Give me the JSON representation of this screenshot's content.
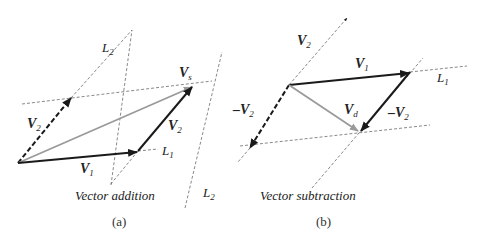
{
  "panels": [
    {
      "id": "a",
      "caption": "(a)",
      "title": "Vector addition",
      "labels": {
        "L2_top": "L",
        "L2_top_sub": "2",
        "V2_left": "V",
        "V2_left_sub": "2",
        "V1": "V",
        "V1_sub": "1",
        "V2_right": "V",
        "V2_right_sub": "2",
        "Vs": "V",
        "Vs_sub": "s",
        "L1": "L",
        "L1_sub": "1",
        "L1_prefix": "–"
      }
    },
    {
      "id": "b",
      "caption": "(b)",
      "title": "Vector subtraction",
      "labels": {
        "V2_top": "V",
        "V2_top_sub": "2",
        "V1": "V",
        "V1_sub": "1",
        "L1": "L",
        "L1_sub": "1",
        "negV2_left": "–V",
        "negV2_left_sub": "2",
        "Vd": "V",
        "Vd_sub": "d",
        "negV2_right": "–V",
        "negV2_right_sub": "2",
        "L2_bottom": "L",
        "L2_bottom_sub": "2"
      }
    }
  ],
  "colors": {
    "solid_vector": "#1a1a1a",
    "result_vector": "#9a9a9a",
    "guide_line": "#555555"
  }
}
